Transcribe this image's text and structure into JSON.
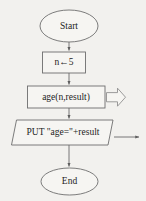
{
  "diagram": {
    "background_color": "#f2f1ee",
    "stroke_color": "#6e6e6e",
    "text_color": "#1d1d1d",
    "nodes": [
      {
        "id": "start",
        "shape": "terminator-oval",
        "label": "Start"
      },
      {
        "id": "assign",
        "shape": "process-rectangle",
        "label": "n←5"
      },
      {
        "id": "call",
        "shape": "process-rectangle",
        "label": "age(n,result)"
      },
      {
        "id": "output",
        "shape": "parallelogram",
        "label": "PUT \"age=\"+result"
      },
      {
        "id": "end",
        "shape": "terminator-oval",
        "label": "End"
      }
    ],
    "connectors": [
      {
        "id": "start-to-assign",
        "from": "start",
        "to": "assign",
        "style": "arrow-down"
      },
      {
        "id": "assign-to-call",
        "from": "assign",
        "to": "call",
        "style": "arrow-down"
      },
      {
        "id": "call-to-output",
        "from": "call",
        "to": "output",
        "style": "arrow-down"
      },
      {
        "id": "output-to-end",
        "from": "output",
        "to": "end",
        "style": "arrow-down"
      }
    ],
    "annotations": [
      {
        "id": "call-block-arrow",
        "kind": "hollow-block-arrow-right",
        "attached_to": "call",
        "label": ""
      },
      {
        "id": "output-line-arrow",
        "kind": "line-arrow-right",
        "attached_to": "output",
        "label": ""
      }
    ]
  }
}
